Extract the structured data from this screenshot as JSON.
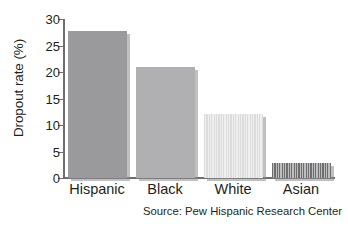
{
  "chart_data": {
    "type": "bar",
    "title": "",
    "xlabel": "",
    "ylabel": "Dropout rate (%)",
    "categories": [
      "Hispanic",
      "Black",
      "White",
      "Asian"
    ],
    "values": [
      27.7,
      20.9,
      12.1,
      2.8
    ],
    "ylim": [
      0,
      30
    ],
    "yticks": [
      0,
      5,
      10,
      15,
      20,
      25,
      30
    ],
    "ytick_labels": [
      "0",
      "5",
      "10",
      "15",
      "20",
      "25",
      "30"
    ],
    "grid": false,
    "legend": "none",
    "bar_colors": [
      "#9a9a9c",
      "#b0b0b2",
      "#dcdcdc",
      "#6e6e70"
    ],
    "bar_patterns": [
      "solid",
      "solid",
      "vertical-stripes",
      "vertical-stripes"
    ],
    "shadow_color": "#8c8c8e",
    "axis_color": "#6d6e71",
    "text_color": "#231f20",
    "annotations": [
      "Source: Pew Hispanic Research Center"
    ]
  },
  "footer": {
    "source_note": "Source: Pew Hispanic Research Center"
  }
}
